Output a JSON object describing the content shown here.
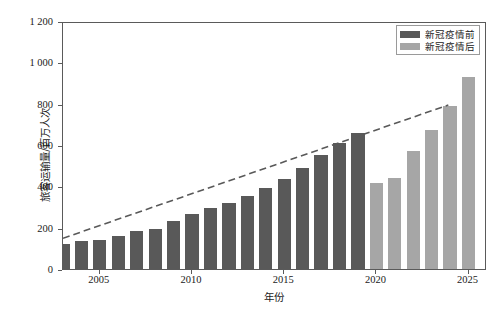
{
  "chart_data": {
    "type": "bar",
    "title": "",
    "subtitle": "",
    "xlabel": "年份",
    "ylabel": "旅客运输量/百万人次",
    "xlim": [
      2003,
      2026
    ],
    "ylim": [
      0,
      1200
    ],
    "grid": false,
    "legend_position": "top-right",
    "x_tick_labels": [
      "2005",
      "2010",
      "2015",
      "2020",
      "2025"
    ],
    "x_tick_values": [
      2005,
      2010,
      2015,
      2020,
      2025
    ],
    "y_tick_labels": [
      "0",
      "200",
      "400",
      "600",
      "800",
      "1 000",
      "1 200"
    ],
    "y_tick_values": [
      0,
      200,
      400,
      600,
      800,
      1000,
      1200
    ],
    "categories": [
      2003,
      2004,
      2005,
      2006,
      2007,
      2008,
      2009,
      2010,
      2011,
      2012,
      2013,
      2014,
      2015,
      2016,
      2017,
      2018,
      2019,
      2020,
      2021,
      2022,
      2023,
      2024,
      2025
    ],
    "series": [
      {
        "name": "新冠疫情前",
        "color": "#595959",
        "values": [
          119,
          136,
          138,
          160,
          185,
          192,
          231,
          268,
          293,
          319,
          354,
          392,
          436,
          488,
          552,
          612,
          660,
          null,
          null,
          null,
          null,
          null,
          null
        ]
      },
      {
        "name": "新冠疫情后",
        "color": "#a6a6a6",
        "values": [
          null,
          null,
          null,
          null,
          null,
          null,
          null,
          null,
          null,
          null,
          null,
          null,
          null,
          null,
          null,
          null,
          null,
          418,
          440,
          570,
          672,
          790,
          930
        ]
      }
    ],
    "annotations": [
      {
        "type": "trendline",
        "style": "dashed",
        "color": "#595959",
        "x_start": 2003,
        "y_start": 150,
        "x_end": 2024,
        "y_end": 800
      }
    ]
  },
  "legend": {
    "items": [
      {
        "label": "新冠疫情前",
        "color": "#595959"
      },
      {
        "label": "新冠疫情后",
        "color": "#a6a6a6"
      }
    ]
  }
}
